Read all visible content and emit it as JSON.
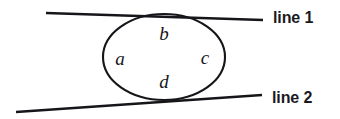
{
  "figure": {
    "type": "geometry-diagram",
    "background_color": "#ffffff",
    "stroke_color": "#16161a",
    "stroke_width": 2.2
  },
  "chart_data": {
    "type": "diagram",
    "title": "",
    "xlabel": "",
    "ylabel": "",
    "grid": false,
    "legend": "none",
    "intersection_point": {
      "x": 164,
      "y": 57
    },
    "circle": {
      "cx": 164,
      "cy": 57,
      "rx": 61,
      "ry": 43
    },
    "lines": [
      {
        "name": "line 1",
        "label": "line 1",
        "x1": 46,
        "y1": 13,
        "x2": 263,
        "y2": 20,
        "direction": "down-right then up-right through center",
        "slope_note": "enters from upper-left, exits to upper-right"
      },
      {
        "name": "line 2",
        "label": "line 2",
        "x1": 16,
        "y1": 112,
        "x2": 262,
        "y2": 95,
        "direction": "up-right",
        "slope_note": "enters from lower-left, exits to lower-right"
      }
    ],
    "angles": [
      {
        "name": "a",
        "label": "a",
        "x": 120,
        "y": 58,
        "position": "left"
      },
      {
        "name": "b",
        "label": "b",
        "x": 164,
        "y": 33,
        "position": "top"
      },
      {
        "name": "c",
        "label": "c",
        "x": 205,
        "y": 57,
        "position": "right"
      },
      {
        "name": "d",
        "label": "d",
        "x": 164,
        "y": 81,
        "position": "bottom"
      }
    ]
  },
  "labels": {
    "angle_a": "a",
    "angle_b": "b",
    "angle_c": "c",
    "angle_d": "d",
    "line_1": "line 1",
    "line_2": "line 2"
  }
}
